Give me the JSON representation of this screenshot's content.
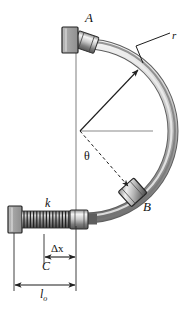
{
  "figure": {
    "title": "",
    "type": "mechanics-free-body-diagram"
  },
  "labels": {
    "collar_a": "A",
    "collar_b": "B",
    "radius": "r",
    "spring_constant": "k",
    "angle": "θ",
    "deflection": "Δx",
    "length_c": "C",
    "natural_length": "l",
    "natural_length_sub": "o"
  },
  "colors": {
    "tube_light": "#d8d8d8",
    "tube_mid": "#9a9a9a",
    "tube_dark": "#6e6e6e",
    "block_fill": "#a8a8a8",
    "block_stroke": "#2b2b2b",
    "line": "#4a4a4a",
    "text": "#111111",
    "background": "#ffffff"
  },
  "geometry": {
    "circle_center_x": 80,
    "circle_center_y": 131,
    "circle_radius": 78,
    "vertical_axis_x": 76,
    "horizontal_axis_y": 131,
    "collar_a_angle_deg": 160,
    "collar_b_angle_deg": 312,
    "spring_left_x": 22,
    "spring_right_x": 70,
    "spring_y": 219,
    "dim_dx_left": 44,
    "dim_dx_right": 76,
    "dim_c_left": 35,
    "dim_c_right": 76,
    "dim_lo_left": 14,
    "dim_lo_right": 76
  },
  "elements": {
    "arc_name": "circular-guide-rod",
    "collar_a_name": "collar-a",
    "collar_b_name": "collar-b",
    "spring_name": "coil-spring",
    "wall_name": "fixed-wall-support",
    "radius_leader_name": "radius-leader-line",
    "angle_arc_name": "angle-theta"
  }
}
